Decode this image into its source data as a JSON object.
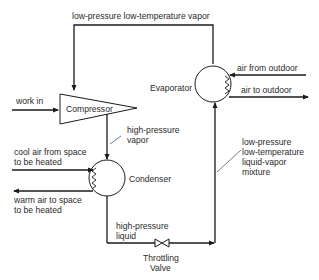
{
  "diagram": {
    "components": {
      "compressor": "Compressor",
      "condenser": "Condenser",
      "evaporator": "Evaporator",
      "throttling_valve_line1": "Throttling",
      "throttling_valve_line2": "Valve"
    },
    "labels": {
      "top_vapor": "low-pressure low-temperature vapor",
      "work_in": "work in",
      "hp_vapor_line1": "high-pressure",
      "hp_vapor_line2": "vapor",
      "cool_air_line1": "cool air from space",
      "cool_air_line2": "to be heated",
      "warm_air_line1": "warm air to space",
      "warm_air_line2": "to be heated",
      "hp_liquid_line1": "high-pressure",
      "hp_liquid_line2": "liquid",
      "mixture_line1": "low-pressure",
      "mixture_line2": "low-temperature",
      "mixture_line3": "liquid-vapor",
      "mixture_line4": "mixture",
      "air_from_outdoor": "air from outdoor",
      "air_to_outdoor": "air to outdoor"
    },
    "colors": {
      "line": "#1a1a1a",
      "text": "#2a2a2a",
      "background": "#ffffff"
    }
  }
}
